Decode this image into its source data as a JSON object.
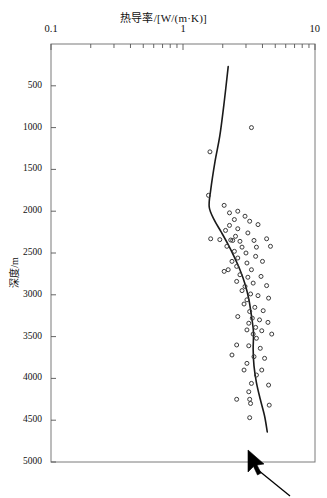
{
  "figure": {
    "title": "热导率/[W/(m·K)]",
    "ylabel": "深度/m",
    "cursor": "mouse-pointer"
  },
  "axis": {
    "x_ticklabels": [
      "0.1",
      "1",
      "10"
    ],
    "y_ticklabels": [
      "500",
      "1000",
      "1500",
      "2000",
      "2500",
      "3000",
      "3500",
      "4000",
      "4500",
      "5000"
    ]
  },
  "chart_data": {
    "type": "scatter",
    "title": "热导率/[W/(m·K)]",
    "xlabel": "热导率/[W/(m·K)]",
    "ylabel": "深度/m",
    "xscale": "log",
    "xlim": [
      0.1,
      10
    ],
    "ylim": [
      0,
      5000
    ],
    "y_inverted": true,
    "grid": false,
    "legend": null,
    "xticks": [
      0.1,
      1,
      10
    ],
    "yticks": [
      500,
      1000,
      1500,
      2000,
      2500,
      3000,
      3500,
      4000,
      4500,
      5000
    ],
    "series": [
      {
        "name": "热导率实测点",
        "marker": "open-circle",
        "points": [
          [
            1.6,
            1290
          ],
          [
            3.3,
            1000
          ],
          [
            1.56,
            1810
          ],
          [
            2.05,
            1930
          ],
          [
            2.25,
            2020
          ],
          [
            2.6,
            2000
          ],
          [
            2.95,
            2060
          ],
          [
            2.45,
            2100
          ],
          [
            3.2,
            2120
          ],
          [
            2.25,
            2170
          ],
          [
            3.7,
            2160
          ],
          [
            2.6,
            2210
          ],
          [
            2.1,
            2230
          ],
          [
            3.1,
            2260
          ],
          [
            2.5,
            2300
          ],
          [
            1.62,
            2330
          ],
          [
            1.9,
            2340
          ],
          [
            2.3,
            2345
          ],
          [
            2.38,
            2350
          ],
          [
            2.7,
            2360
          ],
          [
            3.45,
            2350
          ],
          [
            4.3,
            2330
          ],
          [
            2.15,
            2420
          ],
          [
            2.8,
            2430
          ],
          [
            3.6,
            2430
          ],
          [
            4.6,
            2420
          ],
          [
            2.45,
            2480
          ],
          [
            3.0,
            2500
          ],
          [
            2.6,
            2560
          ],
          [
            3.55,
            2540
          ],
          [
            2.35,
            2600
          ],
          [
            3.05,
            2620
          ],
          [
            4.0,
            2600
          ],
          [
            2.55,
            2660
          ],
          [
            2.2,
            2700
          ],
          [
            2.05,
            2720
          ],
          [
            3.3,
            2700
          ],
          [
            2.7,
            2760
          ],
          [
            3.1,
            2790
          ],
          [
            3.9,
            2780
          ],
          [
            2.55,
            2840
          ],
          [
            3.4,
            2860
          ],
          [
            2.95,
            2900
          ],
          [
            4.3,
            2890
          ],
          [
            2.8,
            2950
          ],
          [
            3.25,
            2990
          ],
          [
            3.7,
            3010
          ],
          [
            3.05,
            3060
          ],
          [
            4.45,
            3040
          ],
          [
            2.9,
            3110
          ],
          [
            3.5,
            3150
          ],
          [
            3.2,
            3200
          ],
          [
            4.05,
            3190
          ],
          [
            2.6,
            3260
          ],
          [
            3.35,
            3280
          ],
          [
            3.8,
            3300
          ],
          [
            3.15,
            3340
          ],
          [
            4.4,
            3330
          ],
          [
            3.55,
            3390
          ],
          [
            3.05,
            3420
          ],
          [
            3.95,
            3430
          ],
          [
            3.4,
            3470
          ],
          [
            4.7,
            3470
          ],
          [
            3.6,
            3520
          ],
          [
            2.55,
            3600
          ],
          [
            3.15,
            3610
          ],
          [
            3.85,
            3640
          ],
          [
            2.35,
            3720
          ],
          [
            3.45,
            3740
          ],
          [
            4.15,
            3760
          ],
          [
            3.05,
            3820
          ],
          [
            2.9,
            3900
          ],
          [
            3.95,
            3900
          ],
          [
            3.6,
            3960
          ],
          [
            3.3,
            4060
          ],
          [
            4.45,
            4080
          ],
          [
            3.15,
            4160
          ],
          [
            2.55,
            4250
          ],
          [
            3.2,
            4250
          ],
          [
            3.25,
            4300
          ],
          [
            4.5,
            4320
          ],
          [
            3.2,
            4470
          ]
        ]
      },
      {
        "name": "热导率拟合曲线",
        "marker": "none",
        "line": "solid",
        "points": [
          [
            2.2,
            270
          ],
          [
            2.05,
            700
          ],
          [
            1.9,
            1100
          ],
          [
            1.75,
            1400
          ],
          [
            1.62,
            1750
          ],
          [
            1.58,
            1950
          ],
          [
            1.72,
            2100
          ],
          [
            1.95,
            2250
          ],
          [
            2.2,
            2400
          ],
          [
            2.45,
            2550
          ],
          [
            2.7,
            2700
          ],
          [
            2.95,
            2870
          ],
          [
            3.15,
            3050
          ],
          [
            3.3,
            3250
          ],
          [
            3.42,
            3450
          ],
          [
            3.4,
            3650
          ],
          [
            3.45,
            3850
          ],
          [
            3.6,
            4050
          ],
          [
            3.85,
            4250
          ],
          [
            4.15,
            4450
          ],
          [
            4.35,
            4640
          ]
        ]
      }
    ]
  }
}
